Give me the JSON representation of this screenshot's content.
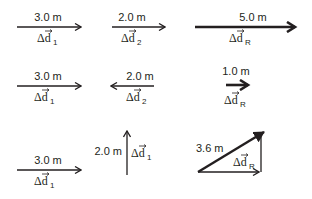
{
  "diagram": {
    "rows": [
      {
        "name": "same-direction-addition",
        "vectors": [
          {
            "id": "d1",
            "magnitude": "3.0 m",
            "symbol": "Δd",
            "subscript": "1",
            "direction": "right"
          },
          {
            "id": "d2",
            "magnitude": "2.0 m",
            "symbol": "Δd",
            "subscript": "2",
            "direction": "right"
          },
          {
            "id": "dR",
            "magnitude": "5.0 m",
            "symbol": "Δd",
            "subscript": "R",
            "direction": "right"
          }
        ]
      },
      {
        "name": "opposite-direction-addition",
        "vectors": [
          {
            "id": "d1",
            "magnitude": "3.0 m",
            "symbol": "Δd",
            "subscript": "1",
            "direction": "right"
          },
          {
            "id": "d2",
            "magnitude": "2.0 m",
            "symbol": "Δd",
            "subscript": "2",
            "direction": "left"
          },
          {
            "id": "dR",
            "magnitude": "1.0 m",
            "symbol": "Δd",
            "subscript": "R",
            "direction": "right"
          }
        ]
      },
      {
        "name": "perpendicular-addition",
        "vectors": [
          {
            "id": "d1",
            "magnitude": "3.0 m",
            "symbol": "Δd",
            "subscript": "1",
            "direction": "right"
          },
          {
            "id": "d2",
            "magnitude": "2.0 m",
            "symbol": "Δd",
            "subscript": "1",
            "direction": "up"
          },
          {
            "id": "dR",
            "magnitude": "3.6 m",
            "symbol": "Δd",
            "subscript": "R",
            "direction": "up-right"
          }
        ]
      }
    ],
    "colors": {
      "stroke": "#231f20",
      "background": "#ffffff"
    }
  }
}
